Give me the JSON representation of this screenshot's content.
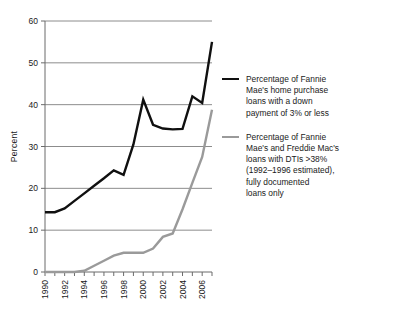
{
  "chart_data": {
    "type": "line",
    "title": "",
    "subtitle": "",
    "xlabel": "",
    "ylabel": "Percent",
    "xlim": [
      1990,
      2007
    ],
    "ylim": [
      0,
      60
    ],
    "ytick_step": 10,
    "yticks": [
      0,
      10,
      20,
      30,
      40,
      50,
      60
    ],
    "ytick_labels": [
      "0",
      "10",
      "20",
      "30",
      "40",
      "50",
      "60"
    ],
    "xticks": [
      1990,
      1992,
      1994,
      1996,
      1998,
      2000,
      2002,
      2004,
      2006
    ],
    "xtick_labels": [
      "1990",
      "1992",
      "1994",
      "1996",
      "1998",
      "2000",
      "2002",
      "2004",
      "2006"
    ],
    "xtick_minor": [
      1991,
      1993,
      1995,
      1997,
      1999,
      2001,
      2003,
      2005,
      2007
    ],
    "grid": "horizontal",
    "legend_position": "right",
    "x": [
      1990,
      1991,
      1992,
      1993,
      1994,
      1995,
      1996,
      1997,
      1998,
      1999,
      2000,
      2001,
      2002,
      2003,
      2004,
      2005,
      2006,
      2007
    ],
    "series": [
      {
        "name": "fannie-low-downpayment",
        "label": "Percentage of Fannie\nMae's home purchase\nloans with a down\npayment of 3% or less",
        "color": "#101010",
        "width": 2.4,
        "values": [
          14.3,
          14.3,
          15.2,
          17.0,
          18.8,
          20.6,
          22.4,
          24.3,
          23.2,
          30.5,
          41.2,
          35.2,
          34.3,
          34.1,
          34.2,
          42.0,
          40.4,
          55.0
        ]
      },
      {
        "name": "fannie-freddie-high-dti",
        "label": "Percentage of Fannie\nMae's and Freddie Mac's\nloans with DTIs >38%\n(1992–1996 estimated),\nfully documented\nloans only",
        "color": "#9a9a9a",
        "width": 2.4,
        "values": [
          0.0,
          0.0,
          0.0,
          0.0,
          0.3,
          1.5,
          2.7,
          3.9,
          4.6,
          4.6,
          4.6,
          5.6,
          8.4,
          9.2,
          15.0,
          21.3,
          27.5,
          38.8
        ]
      }
    ]
  },
  "legend": {
    "entries": [
      {
        "label": "Percentage of Fannie\nMae's home purchase\nloans with a down\npayment of 3% or less",
        "color": "#101010"
      },
      {
        "label": "Percentage of Fannie\nMae's and Freddie Mac's\nloans with DTIs >38%\n(1992–1996 estimated),\nfully documented\nloans only",
        "color": "#9a9a9a"
      }
    ]
  }
}
